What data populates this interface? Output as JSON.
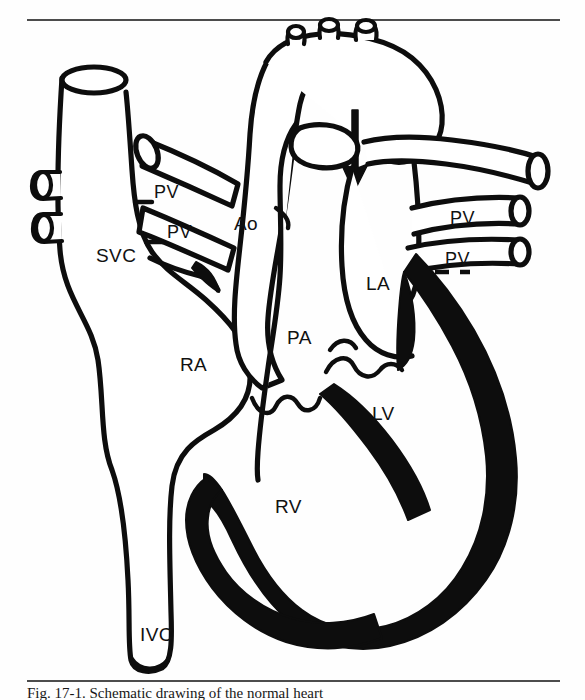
{
  "figure": {
    "kind": "anatomical-line-drawing",
    "background_color": "#fefefe",
    "ink_color": "#0d0d0d",
    "rule_color": "#111111",
    "top_rule": {
      "x1": 27,
      "y1": 20,
      "x2": 560,
      "y2": 20
    },
    "bottom_rule": {
      "x1": 27,
      "y1": 681,
      "x2": 560,
      "y2": 681
    }
  },
  "caption": {
    "text": "Fig. 17-1. Schematic drawing of the normal heart",
    "clipped": true
  },
  "labels": {
    "svc": "SVC",
    "ivc": "IVC",
    "ra": "RA",
    "rv": "RV",
    "la": "LA",
    "lv": "LV",
    "ao": "Ao",
    "pa": "PA",
    "pv_left_upper": "PV",
    "pv_left_lower": "PV",
    "pv_right_upper": "PV",
    "pv_right_lower": "PV"
  },
  "label_positions": {
    "svc": {
      "x": 96,
      "y": 262
    },
    "ivc": {
      "x": 140,
      "y": 641
    },
    "ra": {
      "x": 180,
      "y": 371
    },
    "rv": {
      "x": 275,
      "y": 513
    },
    "la": {
      "x": 366,
      "y": 290
    },
    "lv": {
      "x": 372,
      "y": 420
    },
    "ao": {
      "x": 234,
      "y": 230
    },
    "pa": {
      "x": 287,
      "y": 344
    },
    "pv_left_upper": {
      "x": 154,
      "y": 198
    },
    "pv_left_lower": {
      "x": 167,
      "y": 238
    },
    "pv_right_upper": {
      "x": 450,
      "y": 224
    },
    "pv_right_lower": {
      "x": 445,
      "y": 265
    }
  },
  "structures": [
    {
      "name": "superior-vena-cava",
      "abbr": "SVC",
      "shading": "outline"
    },
    {
      "name": "inferior-vena-cava",
      "abbr": "IVC",
      "shading": "outline"
    },
    {
      "name": "right-atrium",
      "abbr": "RA",
      "shading": "outline"
    },
    {
      "name": "right-ventricle",
      "abbr": "RV",
      "shading": "outline"
    },
    {
      "name": "left-atrium",
      "abbr": "LA",
      "shading": "outline"
    },
    {
      "name": "left-ventricle",
      "abbr": "LV",
      "shading": "filled-myocardium"
    },
    {
      "name": "aorta",
      "abbr": "Ao",
      "shading": "outline"
    },
    {
      "name": "pulmonary-artery",
      "abbr": "PA",
      "shading": "outline"
    },
    {
      "name": "pulmonary-veins",
      "abbr": "PV",
      "count": 4,
      "shading": "outline"
    }
  ],
  "annotations": {
    "flow_arrow": {
      "direction": "down",
      "location": "aortic-arch-to-descending-aorta"
    },
    "arch_branches": 3
  }
}
